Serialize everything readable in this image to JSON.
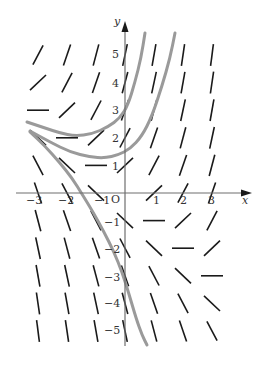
{
  "diagram": {
    "equation": "dy/dx = x + y",
    "axes": {
      "x_label": "x",
      "y_label": "y",
      "origin_label": "O",
      "x_ticks": [
        "-3",
        "-2",
        "-1",
        "1",
        "2",
        "3"
      ],
      "y_ticks": [
        "5",
        "4",
        "3",
        "2",
        "1",
        "-1",
        "-2",
        "-3",
        "-4",
        "-5"
      ]
    },
    "grid": {
      "x_values": [
        -3,
        -2,
        -1,
        0,
        1,
        2,
        3
      ],
      "y_values": [
        5,
        4,
        3,
        2,
        1,
        0,
        -1,
        -2,
        -3,
        -4,
        -5
      ]
    },
    "colors": {
      "segments": "#1a1a1a",
      "curves": "#9a9a9a",
      "axes": "#6e6e6e"
    },
    "solution_curves": [
      {
        "name": "upper",
        "points": [
          [
            27,
            122
          ],
          [
            45,
            128
          ],
          [
            60,
            133
          ],
          [
            75,
            136
          ],
          [
            92,
            134
          ],
          [
            108,
            127
          ],
          [
            120,
            118
          ],
          [
            128,
            105
          ],
          [
            135,
            82
          ],
          [
            141,
            58
          ],
          [
            145,
            33
          ]
        ]
      },
      {
        "name": "middle",
        "points": [
          [
            30,
            131
          ],
          [
            50,
            142
          ],
          [
            70,
            152
          ],
          [
            90,
            157
          ],
          [
            105,
            158
          ],
          [
            118,
            155
          ],
          [
            130,
            149
          ],
          [
            142,
            136
          ],
          [
            152,
            116
          ],
          [
            162,
            86
          ],
          [
            170,
            58
          ],
          [
            175,
            33
          ]
        ]
      },
      {
        "name": "lower",
        "points": [
          [
            30,
            132
          ],
          [
            45,
            146
          ],
          [
            60,
            163
          ],
          [
            72,
            178
          ],
          [
            82,
            194
          ],
          [
            93,
            212
          ],
          [
            104,
            232
          ],
          [
            114,
            252
          ],
          [
            122,
            272
          ],
          [
            129,
            294
          ],
          [
            136,
            318
          ],
          [
            142,
            335
          ],
          [
            147,
            345
          ]
        ]
      }
    ]
  }
}
